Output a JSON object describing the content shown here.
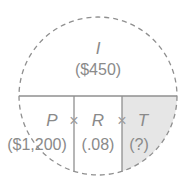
{
  "diagram": {
    "type": "interest formula circle",
    "top": {
      "variable": "I",
      "value": "($450)"
    },
    "bottom": [
      {
        "variable": "P",
        "value": "($1,200)"
      },
      {
        "variable": "R",
        "value": "(.08)"
      },
      {
        "variable": "T",
        "value": "(?)",
        "highlighted": true
      }
    ],
    "operators": [
      "×",
      "×"
    ],
    "colors": {
      "outline": "#8f8f8f",
      "text": "#8a8a8a",
      "highlight_fill": "#e6e6e6"
    }
  }
}
